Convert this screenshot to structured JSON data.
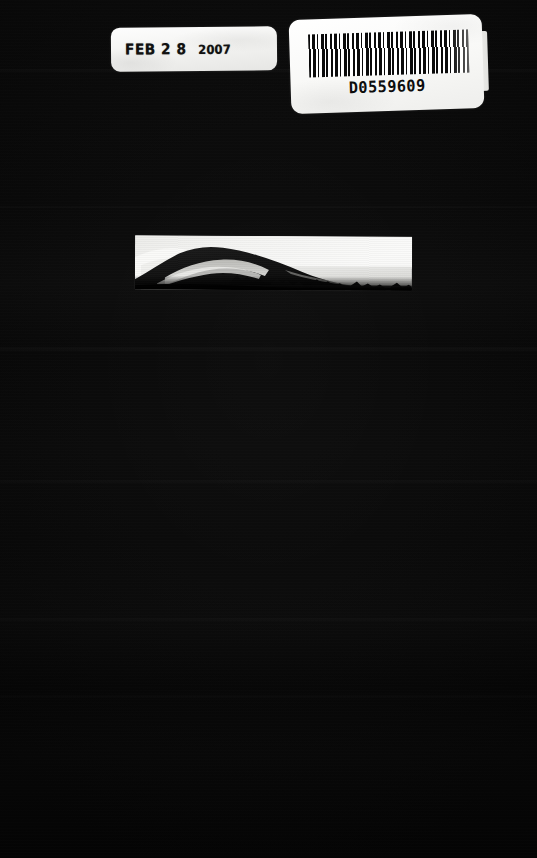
{
  "document": {
    "kind": "scanned-book-cover",
    "background_color": "#0a0a0a",
    "width": 537,
    "height": 858
  },
  "date_stamp": {
    "label_color": "#f7f7f5",
    "month": "FEB",
    "day": "2 8",
    "year": "2007",
    "full_text": "FEB 2 8 2007"
  },
  "barcode": {
    "label_color": "#ffffff",
    "number": "D0559609",
    "symbology": "Code 39"
  },
  "photo": {
    "caption": "",
    "description": "grayscale mountain ridge silhouette against bright sky",
    "paper_color": "#f2f2f0"
  }
}
